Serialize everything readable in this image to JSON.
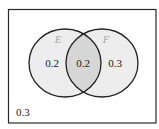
{
  "diagram": {
    "type": "venn",
    "sets": [
      {
        "name": "E",
        "label": "E"
      },
      {
        "name": "F",
        "label": "F"
      }
    ],
    "regions": {
      "e_only": "0.2",
      "e_and_f": "0.2",
      "f_only": "0.3",
      "outside": "0.3"
    },
    "colors": {
      "border": "#2a2a2a",
      "circle_fill": "#ededed",
      "intersection_fill": "#d6d6d6",
      "set_label": "#a8a8a8",
      "value_text": "#1a1a1a"
    }
  }
}
